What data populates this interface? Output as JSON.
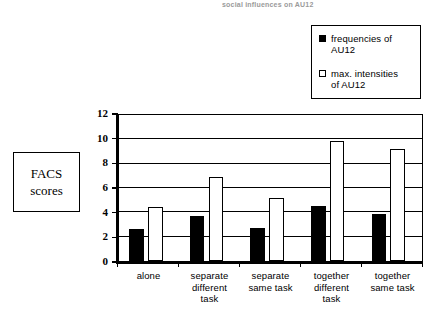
{
  "top_caption": "social influences on AU12",
  "side_label": {
    "line1": "FACS",
    "line2": "scores"
  },
  "legend": {
    "position": "top-right",
    "entries": [
      {
        "swatch": "filled-square-black",
        "line1": "frequencies of",
        "line2": "AU12"
      },
      {
        "swatch": "open-square-white",
        "line1": "max. intensities",
        "line2": "of AU12"
      }
    ]
  },
  "axis": {
    "y_ticks": [
      "0",
      "2",
      "4",
      "6",
      "8",
      "10",
      "12"
    ]
  },
  "chart_data": {
    "type": "bar",
    "title": "",
    "xlabel": "",
    "ylabel": "FACS scores",
    "ylim": [
      0,
      12
    ],
    "ytick_step": 2,
    "grid": true,
    "legend_position": "top-right",
    "categories": [
      "alone",
      "separate different task",
      "separate same task",
      "together different task",
      "together same task"
    ],
    "category_lines": [
      [
        "alone"
      ],
      [
        "separate",
        "different",
        "task"
      ],
      [
        "separate",
        "same task"
      ],
      [
        "together",
        "different",
        "task"
      ],
      [
        "together",
        "same task"
      ]
    ],
    "series": [
      {
        "name": "frequencies of AU12",
        "color": "#000000",
        "fill": "solid",
        "values": [
          2.6,
          3.7,
          2.7,
          4.5,
          3.9
        ]
      },
      {
        "name": "max. intensities of AU12",
        "color": "#ffffff",
        "fill": "open",
        "values": [
          4.4,
          6.9,
          5.2,
          9.9,
          9.2
        ]
      }
    ]
  }
}
